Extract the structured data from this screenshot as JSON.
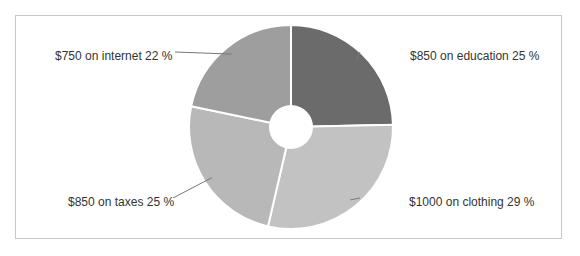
{
  "chart_data": {
    "type": "pie",
    "subtype": "donut",
    "title": "",
    "categories": [
      "education",
      "clothing",
      "taxes",
      "internet"
    ],
    "values": [
      850,
      1000,
      850,
      750
    ],
    "percentages": [
      25,
      29,
      25,
      22
    ],
    "colors": [
      "#6b6b6b",
      "#c2c2c2",
      "#b8b8b8",
      "#9e9e9e"
    ],
    "labels": [
      "$850 on education 25 %",
      "$1000 on clothing 29 %",
      "$850 on taxes 25 %",
      "$750 on internet 22 %"
    ],
    "start_angle_deg": 0,
    "direction": "clockwise",
    "legend": "none"
  }
}
